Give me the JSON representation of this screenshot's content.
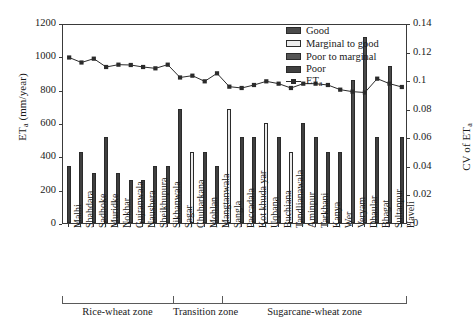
{
  "chart_data": {
    "type": "bar",
    "title": "",
    "xlabel": "",
    "ylabel": "ET",
    "ylabel_sub": "a",
    "ylabel_units": " (mm/year)",
    "y2label": "CV of ET",
    "y2label_sub": "a",
    "grid": false,
    "legend_position": "top-right",
    "ylim": [
      0,
      1200
    ],
    "y2lim": [
      0,
      0.14
    ],
    "yticks": [
      "0",
      "200",
      "400",
      "600",
      "800",
      "1000",
      "1200"
    ],
    "ytick_values": [
      0,
      200,
      400,
      600,
      800,
      1000,
      1200
    ],
    "y2ticks": [
      "0",
      "0.02",
      "0.04",
      "0.06",
      "0.08",
      "0.1",
      "0.12",
      "0.14"
    ],
    "y2tick_values": [
      0,
      0.02,
      0.04,
      0.06,
      0.08,
      0.1,
      0.12,
      0.14
    ],
    "categories": [
      "Malhi",
      "Shahdara",
      "Sadhoke",
      "Muridke",
      "Nokhar",
      "Gujranwala",
      "Naushera",
      "Sheikhupura",
      "Sikhanwala",
      "Sagar",
      "Chuharkana",
      "Mohlan",
      "Mangtanwala",
      "Sangla",
      "Paccadala",
      "Kot khuda yar",
      "Uqbana",
      "Buchiana",
      "Tandlianawala",
      "Aminpur",
      "Tarkhani",
      "Kanya",
      "Wer",
      "Veryam",
      "Dhaular",
      "Bhagat",
      "Sultanpur",
      "Haveli"
    ],
    "series": [
      {
        "name": "CV of ETa (bars)",
        "axis": "right",
        "values": [
          0.04,
          0.05,
          0.035,
          0.06,
          0.035,
          0.03,
          0.03,
          0.04,
          0.04,
          0.08,
          0.05,
          0.05,
          0.04,
          0.08,
          0.06,
          0.06,
          0.07,
          0.06,
          0.05,
          0.07,
          0.06,
          0.05,
          0.05,
          0.1,
          0.13,
          0.06,
          0.11,
          0.06
        ],
        "quality": [
          "poor",
          "poor",
          "poor",
          "poor",
          "poor",
          "poor",
          "poor",
          "poor",
          "poor",
          "poor",
          "marginal-to-good",
          "poor",
          "poor",
          "marginal-to-good",
          "poor",
          "poor",
          "marginal-to-good",
          "poor",
          "marginal-to-good",
          "poor",
          "poor",
          "poor",
          "poor",
          "good",
          "good",
          "poor",
          "good",
          "poor"
        ]
      },
      {
        "name": "ETa",
        "axis": "left",
        "values": [
          1005,
          975,
          998,
          948,
          962,
          960,
          948,
          940,
          962,
          885,
          896,
          862,
          910,
          830,
          822,
          840,
          862,
          848,
          822,
          848,
          848,
          840,
          812,
          800,
          795,
          878,
          848,
          828
        ]
      }
    ],
    "bar_legend": [
      {
        "key": "good",
        "label": "Good"
      },
      {
        "key": "m2g",
        "label": "Marginal to good"
      },
      {
        "key": "p2m",
        "label": "Poor to marginal"
      },
      {
        "key": "poor",
        "label": "Poor"
      }
    ],
    "line_legend": {
      "label": "ET",
      "sub": "a"
    },
    "zones": [
      {
        "label": "Rice-wheat zone",
        "start": 0,
        "end": 8
      },
      {
        "label": "Transition zone",
        "start": 9,
        "end": 12
      },
      {
        "label": "Sugarcane-wheat zone",
        "start": 13,
        "end": 27
      }
    ],
    "colors": {
      "good": "#4a4a4a",
      "marginal_to_good": "#ececec",
      "poor_to_marginal": "#555555",
      "poor": "#3f3f3f",
      "line": "#2b2b2b",
      "axis": "#3a3a3a",
      "background": "#ffffff"
    }
  }
}
